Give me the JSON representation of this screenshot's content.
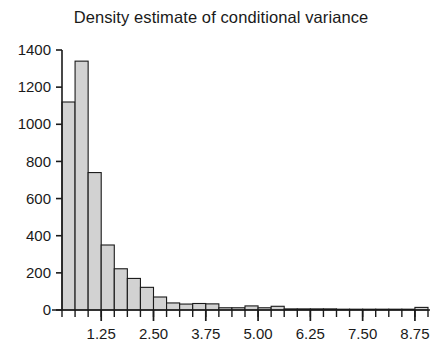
{
  "chart_data": {
    "type": "bar",
    "title": "Density estimate of conditional variance",
    "subtitle": "",
    "xlabel": "",
    "ylabel": "",
    "xlim": [
      0.3125,
      9.0625
    ],
    "ylim": [
      0,
      1400
    ],
    "grid": false,
    "legend": null,
    "bin_width": 0.3125,
    "xticks": [
      1.25,
      2.5,
      3.75,
      5.0,
      6.25,
      7.5,
      8.75
    ],
    "xtick_labels": [
      "1.25",
      "2.50",
      "3.75",
      "5.00",
      "6.25",
      "7.50",
      "8.75"
    ],
    "yticks": [
      0,
      200,
      400,
      600,
      800,
      1000,
      1200,
      1400
    ],
    "ytick_labels": [
      "0",
      "200",
      "400",
      "600",
      "800",
      "1000",
      "1200",
      "1400"
    ],
    "bar_fill_color": "#d2d2d2",
    "bar_edge_color": "#1a1a1a",
    "axis_color": "#1a1a1a",
    "bin_left_edges": [
      0.3125,
      0.625,
      0.9375,
      1.25,
      1.5625,
      1.875,
      2.1875,
      2.5,
      2.8125,
      3.125,
      3.4375,
      3.75,
      4.0625,
      4.375,
      4.6875,
      5.0,
      5.3125,
      5.625,
      5.9375,
      6.25,
      6.5625,
      6.875,
      7.1875,
      7.5,
      7.8125,
      8.125,
      8.4375,
      8.75
    ],
    "values": [
      1120,
      1340,
      740,
      350,
      222,
      170,
      122,
      70,
      38,
      32,
      35,
      33,
      12,
      12,
      22,
      12,
      20,
      6,
      6,
      6,
      6,
      4,
      4,
      4,
      2,
      2,
      2,
      14
    ],
    "categories": [
      "0.31",
      "0.63",
      "0.94",
      "1.25",
      "1.56",
      "1.88",
      "2.19",
      "2.50",
      "2.81",
      "3.13",
      "3.44",
      "3.75",
      "4.06",
      "4.38",
      "4.69",
      "5.00",
      "5.31",
      "5.63",
      "5.94",
      "6.25",
      "6.56",
      "6.88",
      "7.19",
      "7.50",
      "7.81",
      "8.13",
      "8.44",
      "8.75"
    ]
  }
}
